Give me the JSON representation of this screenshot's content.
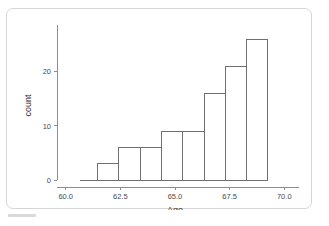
{
  "chart_data": {
    "type": "bar",
    "title": "",
    "subtitle": "",
    "xlabel": "Age",
    "ylabel": "count",
    "xlim": [
      59.6,
      70.4
    ],
    "ylim": [
      0,
      27.5
    ],
    "xticks": [
      "60.0",
      "62.5",
      "65.0",
      "67.5",
      "70.0"
    ],
    "xtick_values": [
      60.0,
      62.5,
      65.0,
      67.5,
      70.0
    ],
    "yticks": [
      "0",
      "10",
      "20"
    ],
    "ytick_values": [
      0,
      10,
      20
    ],
    "grid": false,
    "legend": "none",
    "bin_width": 0.975,
    "bar_fill": "#ffffff",
    "bar_stroke": "#6f6f6f",
    "axis_color": "#8d8d8d",
    "bins": [
      {
        "x_start": 61.45,
        "x_end": 62.43,
        "center": 61.94,
        "count": 3
      },
      {
        "x_start": 62.43,
        "x_end": 63.4,
        "center": 62.91,
        "count": 6
      },
      {
        "x_start": 63.4,
        "x_end": 64.38,
        "center": 63.89,
        "count": 6
      },
      {
        "x_start": 64.38,
        "x_end": 65.35,
        "center": 64.86,
        "count": 9
      },
      {
        "x_start": 65.35,
        "x_end": 66.33,
        "center": 65.84,
        "count": 9
      },
      {
        "x_start": 66.33,
        "x_end": 67.3,
        "center": 66.81,
        "count": 16
      },
      {
        "x_start": 67.3,
        "x_end": 68.28,
        "center": 67.79,
        "count": 21
      },
      {
        "x_start": 68.28,
        "x_end": 69.25,
        "center": 68.76,
        "count": 26
      }
    ],
    "categories": [
      "61.9",
      "62.9",
      "63.9",
      "64.9",
      "65.8",
      "66.8",
      "67.8",
      "68.8"
    ],
    "values": [
      3,
      6,
      6,
      9,
      9,
      16,
      21,
      26
    ],
    "baseline_start_x": 60.65,
    "baseline_end_x": 69.25
  }
}
